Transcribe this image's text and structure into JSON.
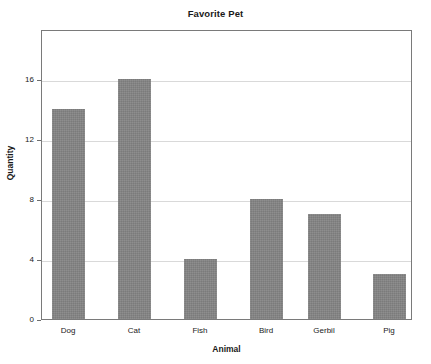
{
  "chart_data": {
    "type": "bar",
    "title": "Favorite Pet",
    "xlabel": "Animal",
    "ylabel": "Quantity",
    "categories": [
      "Dog",
      "Cat",
      "Fish",
      "Bird",
      "Gerbil",
      "Pig"
    ],
    "values": [
      14,
      16,
      4,
      8,
      7,
      3
    ],
    "series": [
      {
        "name": "Quantity",
        "values": [
          14,
          16,
          4,
          8,
          7,
          3
        ]
      }
    ],
    "ylim": [
      0,
      19.3
    ],
    "xlim": [
      0,
      6
    ],
    "yticks": [
      0,
      4,
      8,
      12,
      16
    ],
    "ytick_labels": [
      "0",
      "4",
      "8",
      "12",
      "16"
    ],
    "grid": "horizontal",
    "legend": "none",
    "bar_color": "#838383",
    "frame_color": "#7a7a7a",
    "gridline_color": "#d9d9d9",
    "background_color": "#ffffff",
    "text_color": "#1a1a1a"
  },
  "labels": {
    "tick_0": "0",
    "tick_1": "4",
    "tick_2": "8",
    "tick_3": "12",
    "tick_4": "16",
    "cat_0": "Dog",
    "cat_1": "Cat",
    "cat_2": "Fish",
    "cat_3": "Bird",
    "cat_4": "Gerbil",
    "cat_5": "Pig"
  }
}
